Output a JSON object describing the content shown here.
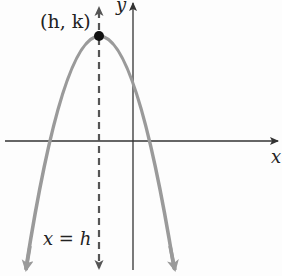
{
  "diagram": {
    "vertex_label": "(h, k)",
    "axis_of_symmetry_label": "x = h",
    "x_axis_label": "x",
    "y_axis_label": "y",
    "colors": {
      "parabola": "#9a9a9a",
      "axes": "#333333",
      "symmetry_line": "#555555",
      "vertex_point": "#111111",
      "background": "#fdfdfd"
    }
  }
}
